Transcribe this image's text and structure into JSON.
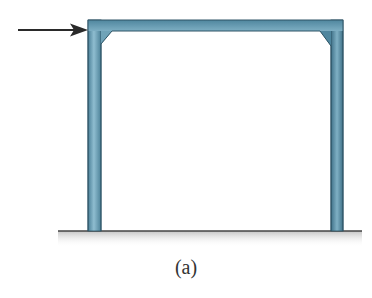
{
  "figure": {
    "caption": "(a)",
    "colors": {
      "frame_fill": "#5b93ab",
      "frame_highlight": "#8fbdd0",
      "frame_edge": "#2f5566",
      "arrow": "#2a2a2a",
      "ground_line": "#444444",
      "ground_shadow": "#c9c9c9"
    },
    "icons": {
      "load": "arrow-right-icon"
    }
  }
}
